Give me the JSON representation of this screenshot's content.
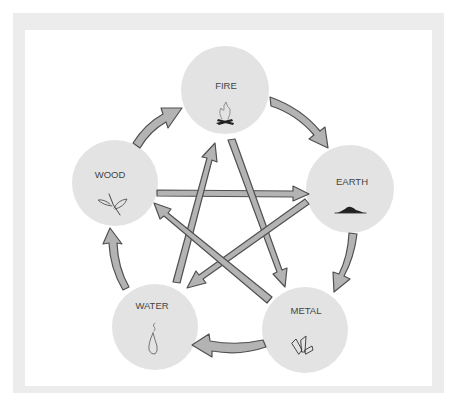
{
  "diagram": {
    "title": "",
    "colors": {
      "frame_border": "#ececec",
      "background": "#ffffff",
      "node_fill": "#e3e3e3",
      "arrow_fill": "#b3b3b3",
      "arrow_stroke": "#505050",
      "label_color": "#444444"
    },
    "nodes": [
      {
        "id": "fire",
        "label": "FIRE",
        "icon": "campfire-icon",
        "cx": 225,
        "cy": 90,
        "r": 44
      },
      {
        "id": "earth",
        "label": "EARTH",
        "icon": "soil-mound-icon",
        "cx": 350,
        "cy": 189,
        "r": 44
      },
      {
        "id": "metal",
        "label": "METAL",
        "icon": "crystal-icon",
        "cx": 305,
        "cy": 330,
        "r": 43
      },
      {
        "id": "water",
        "label": "WATER",
        "icon": "water-drop-icon",
        "cx": 155,
        "cy": 327,
        "r": 43
      },
      {
        "id": "wood",
        "label": "WOOD",
        "icon": "sprout-leaves-icon",
        "cx": 115,
        "cy": 183,
        "r": 43
      }
    ],
    "generating_cycle": [
      {
        "from": "fire",
        "to": "earth"
      },
      {
        "from": "earth",
        "to": "metal"
      },
      {
        "from": "metal",
        "to": "water"
      },
      {
        "from": "water",
        "to": "wood"
      },
      {
        "from": "wood",
        "to": "fire"
      }
    ],
    "overcoming_star": [
      {
        "from": "wood",
        "to": "earth"
      },
      {
        "from": "earth",
        "to": "water"
      },
      {
        "from": "water",
        "to": "fire"
      },
      {
        "from": "fire",
        "to": "metal"
      },
      {
        "from": "metal",
        "to": "wood"
      }
    ]
  }
}
